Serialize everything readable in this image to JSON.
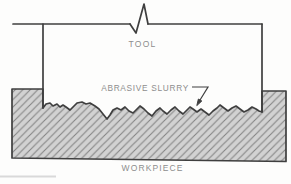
{
  "figure": {
    "labels": {
      "tool": "TOOL",
      "abrasive_slurry": "ABRASIVE SLURRY",
      "workpiece": "WORKPIECE"
    },
    "colors": {
      "background": "#fdfdfc",
      "outline": "#3f3f3f",
      "label_text": "#8d8d8d",
      "hatch_fill": "#d2d2d2",
      "hatch_line": "#858585",
      "artifact_line": "#d9d9d9"
    }
  }
}
